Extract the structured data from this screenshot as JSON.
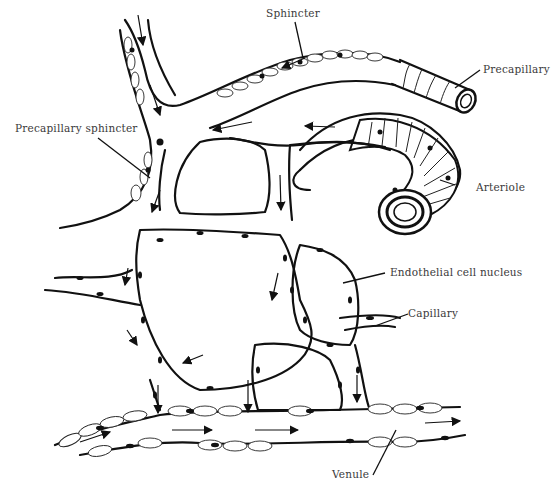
{
  "diagram": {
    "labels": [
      {
        "id": "sphincter",
        "text": "Sphincter"
      },
      {
        "id": "precapillary",
        "text": "Precapillary"
      },
      {
        "id": "precapillary_sphincter",
        "text": "Precapillary sphincter"
      },
      {
        "id": "arteriole",
        "text": "Arteriole"
      },
      {
        "id": "endothelial_nucleus",
        "text": "Endothelial cell nucleus"
      },
      {
        "id": "capillary",
        "text": "Capillary"
      },
      {
        "id": "venule",
        "text": "Venule"
      }
    ],
    "colors": {
      "ink": "#111111",
      "label": "#3a3a3a",
      "background": "#ffffff"
    }
  }
}
